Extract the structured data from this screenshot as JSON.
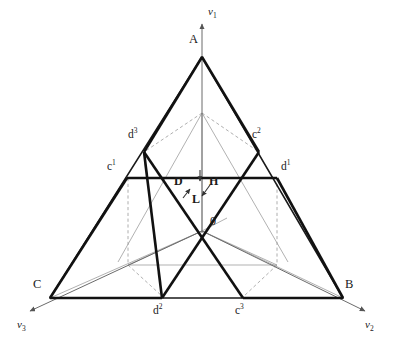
{
  "figure": {
    "background": "#ffffff",
    "line_color": "#1a1a1a",
    "thin_line_color": "#8c8c8c",
    "dashed_color": "#9a9a9a"
  },
  "vertices": {
    "A": {
      "label": "A",
      "x": 202,
      "y": 57,
      "label_x": 189,
      "label_y": 33
    },
    "B": {
      "label": "B",
      "x": 343,
      "y": 298,
      "label_x": 345,
      "label_y": 278
    },
    "C": {
      "label": "C",
      "x": 50,
      "y": 298,
      "label_x": 33,
      "label_y": 278
    }
  },
  "points": {
    "c1": {
      "label": "c",
      "sup": "1",
      "x": 127,
      "y": 178,
      "label_x": 107,
      "label_y": 160
    },
    "d1": {
      "label": "d",
      "sup": "1",
      "x": 277,
      "y": 178,
      "label_x": 280,
      "label_y": 160
    },
    "d3": {
      "label": "d",
      "sup": "3",
      "x": 144,
      "y": 152,
      "label_x": 129,
      "label_y": 128
    },
    "c2": {
      "label": "c",
      "sup": "2",
      "x": 259,
      "y": 152,
      "label_x": 252,
      "label_y": 128
    },
    "d2": {
      "label": "d",
      "sup": "2",
      "x": 162,
      "y": 298,
      "label_x": 153,
      "label_y": 305
    },
    "c3": {
      "label": "c",
      "sup": "3",
      "x": 243,
      "y": 298,
      "label_x": 235,
      "label_y": 305
    },
    "O": {
      "label": "0",
      "x": 202,
      "y": 231,
      "label_x": 210,
      "label_y": 215
    }
  },
  "axes": [
    {
      "name": "v1",
      "label": "v",
      "sub": "1",
      "label_x": 208,
      "label_y": 6,
      "from_x": 202,
      "from_y": 231,
      "to_x": 202,
      "to_y": 22
    },
    {
      "name": "v2",
      "label": "v",
      "sub": "2",
      "label_x": 365,
      "label_y": 320,
      "from_x": 202,
      "from_y": 231,
      "to_x": 368,
      "to_y": 313
    },
    {
      "name": "v3",
      "label": "v",
      "sub": "3",
      "label_x": 17,
      "label_y": 320,
      "from_x": 202,
      "from_y": 231,
      "to_x": 27,
      "to_y": 313
    }
  ],
  "field_labels": [
    {
      "name": "D",
      "label": "D",
      "x": 175,
      "y": 175
    },
    {
      "name": "H",
      "label": "H",
      "x": 209,
      "y": 175
    },
    {
      "name": "L",
      "label": "L",
      "x": 192,
      "y": 192
    }
  ],
  "field_arrows": [
    {
      "name": "arrow-D-down",
      "x1": 200,
      "y1": 171,
      "x2": 200,
      "y2": 182
    },
    {
      "name": "arrow-L-upleft",
      "x1": 184,
      "y1": 196,
      "x2": 190,
      "y2": 188
    },
    {
      "name": "arrow-L-downleft",
      "x1": 208,
      "y1": 186,
      "x2": 201,
      "y2": 196
    }
  ],
  "geometry_notes": {
    "outer_triangle": "A-B-C bold outline",
    "medial_bold_segments": [
      "c1-d1 horizontal",
      "d3-d2 left-descending",
      "c2-c3 right-descending",
      "A-d3 short",
      "A-c2 short",
      "C-c1 short",
      "B-d1 short",
      "d2-C short",
      "c3-B short"
    ],
    "dashed_back_edges": true,
    "thin_perspective_lines": true
  }
}
